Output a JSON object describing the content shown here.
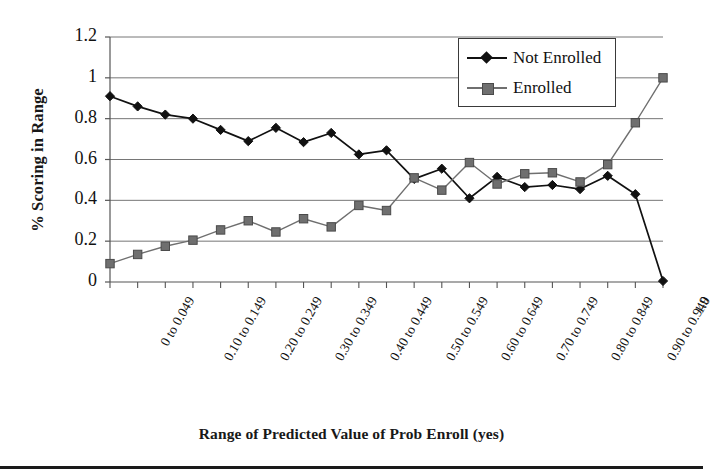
{
  "chart_data": {
    "type": "line",
    "title": "",
    "xlabel": "Range of Predicted Value of Prob Enroll (yes)",
    "ylabel": "% Scoring in Range",
    "ylim": [
      0,
      1.2
    ],
    "ytick_labels": [
      "0",
      "0.2",
      "0.4",
      "0.6",
      "0.8",
      "1",
      "1.2"
    ],
    "ytick_values": [
      0,
      0.2,
      0.4,
      0.6,
      0.8,
      1,
      1.2
    ],
    "grid": "horizontal",
    "legend_position": "top-right",
    "categories": [
      "0 to 0.049",
      "0.05 to 0.099",
      "0.10 to 0.149",
      "0.15 to 0.199",
      "0.20 to 0.249",
      "0.25 to 0.299",
      "0.30 to 0.349",
      "0.35 to 0.399",
      "0.40 to 0.449",
      "0.45 to 0.499",
      "0.50 to 0.549",
      "0.55 to 0.599",
      "0.60 to 0.649",
      "0.65 to 0.699",
      "0.70 to 0.749",
      "0.75 to 0.799",
      "0.80 to 0.849",
      "0.85 to 0.899",
      "0.90 to 0.949",
      "0.95 to 0.999",
      "1.0"
    ],
    "visible_xtick_labels": [
      "0 to 0.049",
      "0.10 to 0.149",
      "0.20 to 0.249",
      "0.30 to 0.349",
      "0.40 to 0.449",
      "0.50 to 0.549",
      "0.60 to 0.649",
      "0.70 to 0.749",
      "0.80 to 0.849",
      "0.90 to 0.949",
      "1.0"
    ],
    "visible_xtick_indices": [
      0,
      2,
      4,
      6,
      8,
      10,
      12,
      14,
      16,
      18,
      20
    ],
    "series": [
      {
        "name": "Not Enrolled",
        "color": "#111111",
        "marker": "diamond",
        "values": [
          0.91,
          0.86,
          0.82,
          0.8,
          0.745,
          0.69,
          0.755,
          0.685,
          0.73,
          0.625,
          0.645,
          0.505,
          0.555,
          0.41,
          0.515,
          0.465,
          0.475,
          0.455,
          0.52,
          0.43,
          0.005
        ]
      },
      {
        "name": "Enrolled",
        "color": "#6f6f6f",
        "marker": "square",
        "values": [
          0.09,
          0.135,
          0.175,
          0.205,
          0.255,
          0.3,
          0.245,
          0.31,
          0.27,
          0.375,
          0.35,
          0.51,
          0.45,
          0.585,
          0.48,
          0.53,
          0.535,
          0.49,
          0.575,
          0.78,
          1.0
        ]
      }
    ]
  },
  "legend": {
    "items": [
      {
        "label": "Not Enrolled",
        "marker": "diamond",
        "color": "#111111"
      },
      {
        "label": "Enrolled",
        "marker": "square",
        "color": "#6f6f6f"
      }
    ]
  }
}
